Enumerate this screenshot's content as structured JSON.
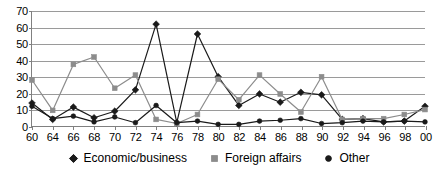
{
  "chart_data": {
    "type": "line",
    "title": "",
    "subtitle": "",
    "xlabel": "",
    "ylabel": "",
    "xlim": [
      0,
      19
    ],
    "ylim": [
      0,
      70
    ],
    "ytick_step": 10,
    "yticks": [
      0,
      10,
      20,
      30,
      40,
      50,
      60,
      70
    ],
    "categories": [
      "60",
      "64",
      "66",
      "68",
      "70",
      "72",
      "74",
      "76",
      "78",
      "80",
      "82",
      "84",
      "86",
      "88",
      "90",
      "92",
      "94",
      "96",
      "98",
      "00"
    ],
    "grid": true,
    "legend_position": "bottom",
    "series": [
      {
        "name": "Economic/business",
        "marker": "diamond",
        "color": "#1a1a1a",
        "values": [
          14,
          4,
          11.5,
          5,
          9,
          22,
          12,
          2,
          56,
          30,
          12.5,
          19.5,
          14.5,
          20.5,
          19,
          4,
          4.5,
          2.5,
          3,
          12
        ]
      },
      {
        "name": "Foreign affairs",
        "marker": "square",
        "color": "#8c8c8c",
        "values": [
          28,
          9.5,
          37.5,
          42,
          23,
          31,
          4,
          1.5,
          7,
          28.5,
          16,
          31,
          19.5,
          8.5,
          30,
          4,
          4.5,
          4.5,
          7,
          10
        ]
      },
      {
        "name": "Other",
        "marker": "circle",
        "color": "#1a1a1a",
        "values": [
          12,
          4.5,
          6,
          2.5,
          5.5,
          2,
          12.5,
          2,
          3,
          1,
          1,
          3,
          3.5,
          4.5,
          1.5,
          2,
          3,
          2.5,
          3,
          2.5
        ]
      }
    ],
    "peaks": [
      {
        "series": "Economic/business",
        "category": "74",
        "value": 62
      },
      {
        "series": "Economic/business",
        "category": "78",
        "value": 56
      }
    ]
  },
  "legend": {
    "items": [
      {
        "label": "Economic/business",
        "marker": "diamond-marker-icon"
      },
      {
        "label": "Foreign affairs",
        "marker": "square-marker-icon"
      },
      {
        "label": "Other",
        "marker": "circle-marker-icon"
      }
    ]
  }
}
